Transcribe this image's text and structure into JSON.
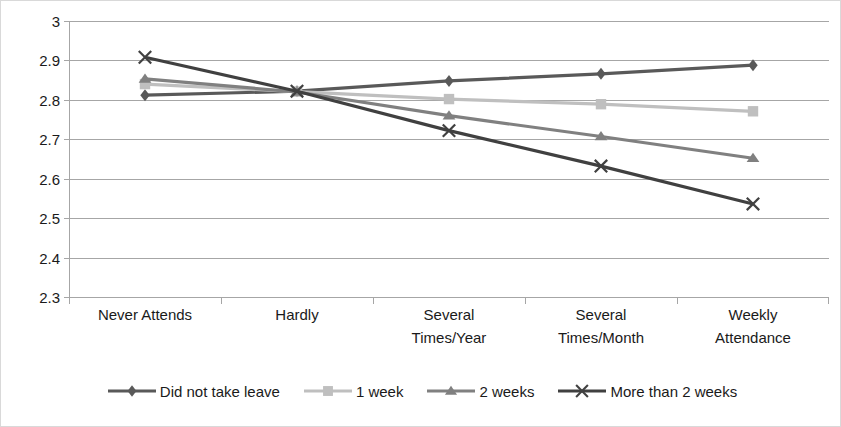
{
  "chart_data": {
    "type": "line",
    "title": "",
    "xlabel": "",
    "ylabel": "Relationship Conflict",
    "categories": [
      "Never Attends",
      "Hardly",
      "Several Times/Year",
      "Several Times/Month",
      "Weekly Attendance"
    ],
    "category_lines": [
      [
        "Never Attends"
      ],
      [
        "Hardly"
      ],
      [
        "Several",
        "Times/Year"
      ],
      [
        "Several",
        "Times/Month"
      ],
      [
        "Weekly",
        "Attendance"
      ]
    ],
    "ylim": [
      2.3,
      3.0
    ],
    "yticks": [
      "2.3",
      "2.4",
      "2.5",
      "2.6",
      "2.7",
      "2.8",
      "2.9",
      "3"
    ],
    "ytick_values": [
      2.3,
      2.4,
      2.5,
      2.6,
      2.7,
      2.8,
      2.9,
      3.0
    ],
    "grid": true,
    "legend_position": "bottom",
    "series": [
      {
        "name": "Did not take leave",
        "marker": "diamond",
        "color": "#595959",
        "values": [
          2.812,
          2.822,
          2.848,
          2.866,
          2.888
        ]
      },
      {
        "name": "1 week",
        "marker": "square",
        "color": "#bfbfbf",
        "values": [
          2.84,
          2.821,
          2.802,
          2.789,
          2.771
        ]
      },
      {
        "name": "2 weeks",
        "marker": "triangle",
        "color": "#808080",
        "values": [
          2.853,
          2.82,
          2.76,
          2.707,
          2.652
        ]
      },
      {
        "name": "More than 2 weeks",
        "marker": "x",
        "color": "#404040",
        "values": [
          2.908,
          2.822,
          2.722,
          2.632,
          2.536
        ]
      }
    ]
  },
  "legend": {
    "items": [
      {
        "label": "Did not take leave",
        "marker": "diamond",
        "color": "#595959"
      },
      {
        "label": "1 week",
        "marker": "square",
        "color": "#bfbfbf"
      },
      {
        "label": "2 weeks",
        "marker": "triangle",
        "color": "#808080"
      },
      {
        "label": "More than 2 weeks",
        "marker": "x",
        "color": "#404040"
      }
    ]
  }
}
